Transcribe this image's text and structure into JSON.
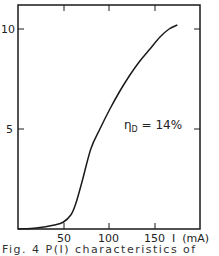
{
  "chart_data": {
    "type": "line",
    "title": "",
    "xlabel": "I (mA)",
    "ylabel": "",
    "xlim": [
      0,
      190
    ],
    "ylim": [
      0,
      11
    ],
    "x_ticks": [
      50,
      100,
      150
    ],
    "x_tick_labels": [
      "50",
      "100",
      "150"
    ],
    "y_ticks": [
      5,
      10
    ],
    "y_tick_labels": [
      "5",
      "10"
    ],
    "grid": false,
    "legend": null,
    "annotations": [
      {
        "text": "η_D = 14%",
        "x": 112,
        "y": 5.0
      }
    ],
    "series": [
      {
        "name": "P(I)",
        "x": [
          0,
          20,
          40,
          50,
          58,
          63,
          70,
          80,
          90,
          101,
          112,
          123,
          134,
          145,
          156,
          166,
          175
        ],
        "values": [
          0,
          0.05,
          0.2,
          0.35,
          0.7,
          1.2,
          2.3,
          4.0,
          5.0,
          6.0,
          6.9,
          7.7,
          8.4,
          9.0,
          9.6,
          10.0,
          10.2
        ]
      }
    ]
  },
  "labels": {
    "y10": "10",
    "y5": "5",
    "x50": "50",
    "x100": "100",
    "x150": "150",
    "xaxis": "I  (mA)",
    "eta": "η",
    "eta_sub": "D",
    "eta_value": " = 14%"
  },
  "caption": "Fig. 4  P(I) characteristics of"
}
